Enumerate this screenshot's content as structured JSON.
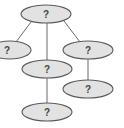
{
  "diagram": {
    "type": "tree",
    "nodes": [
      {
        "id": "root",
        "label": "?",
        "cx": 46,
        "cy": 14,
        "rx": 25,
        "ry": 9
      },
      {
        "id": "left",
        "label": "?",
        "cx": 10,
        "cy": 50,
        "rx": 21,
        "ry": 9
      },
      {
        "id": "right",
        "label": "?",
        "cx": 88,
        "cy": 50,
        "rx": 25,
        "ry": 9
      },
      {
        "id": "middle",
        "label": "?",
        "cx": 47,
        "cy": 69,
        "rx": 25,
        "ry": 9
      },
      {
        "id": "right-child",
        "label": "?",
        "cx": 88,
        "cy": 89,
        "rx": 25,
        "ry": 9
      },
      {
        "id": "bottom",
        "label": "?",
        "cx": 47,
        "cy": 112,
        "rx": 25,
        "ry": 9
      }
    ],
    "edges": [
      {
        "from": "root",
        "to": "left"
      },
      {
        "from": "root",
        "to": "middle"
      },
      {
        "from": "root",
        "to": "right"
      },
      {
        "from": "middle",
        "to": "bottom"
      },
      {
        "from": "right",
        "to": "right-child"
      }
    ]
  }
}
